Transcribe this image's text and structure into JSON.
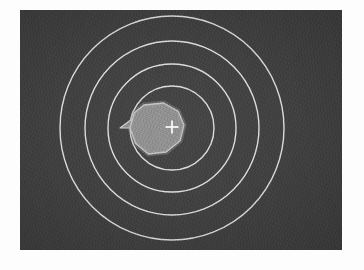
{
  "figure": {
    "title": "",
    "caption": "",
    "panel": {
      "background_color": "#3e3e3e",
      "stroke_color": "#e8e8e8",
      "blob_fill_color": "#8c8c8c",
      "blob_stroke_color": "#d8d8d8",
      "marker_color": "#ffffff",
      "width_px": 322,
      "height_px": 240,
      "left_px": 20,
      "top_px": 10
    }
  },
  "chart_data": {
    "type": "scatter",
    "title": "",
    "subtitle": "",
    "xlabel": "",
    "ylabel": "",
    "grid": true,
    "legend_position": "none",
    "center": {
      "x_px": 172,
      "y_px": 128
    },
    "rings": [
      {
        "name": "ring-1",
        "radius_px": 42,
        "label": ""
      },
      {
        "name": "ring-2",
        "radius_px": 64,
        "label": ""
      },
      {
        "name": "ring-3",
        "radius_px": 87,
        "label": ""
      },
      {
        "name": "ring-4",
        "radius_px": 112,
        "label": ""
      }
    ],
    "markers": [
      {
        "name": "cross-marker",
        "x_px": 172,
        "y_px": 127,
        "symbol": "+",
        "color": "#ffffff",
        "size_px": 13
      }
    ],
    "blob": {
      "name": "central-source",
      "centroid_x_px": 156,
      "centroid_y_px": 128,
      "extent_x_px": [
        130,
        184
      ],
      "extent_y_px": [
        103,
        154
      ],
      "spike_tip_x_px": 120,
      "spike_tip_y_px": 128
    },
    "annotations": []
  },
  "labels": {
    "panel_name": "range-ring-display",
    "ring_group": "range-rings",
    "blob_name": "central-source-blob",
    "marker_name": "crosshair-marker"
  }
}
